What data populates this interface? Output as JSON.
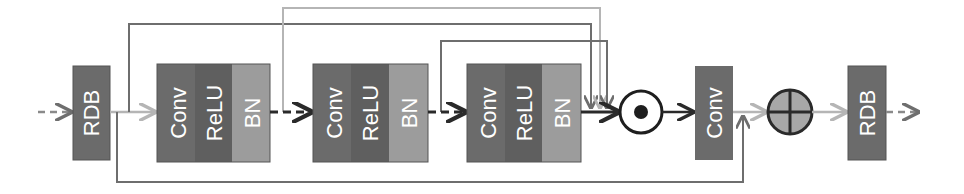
{
  "diagram": {
    "input_block": {
      "label": "RDB"
    },
    "output_block": {
      "label": "RDB"
    },
    "stages": [
      {
        "conv": "Conv",
        "relu": "ReLU",
        "bn": "BN"
      },
      {
        "conv": "Conv",
        "relu": "ReLU",
        "bn": "BN"
      },
      {
        "conv": "Conv",
        "relu": "ReLU",
        "bn": "BN"
      }
    ],
    "fusion_conv": {
      "label": "Conv"
    },
    "operators": {
      "multiply": "element-wise product (circle-dot)",
      "add": "element-wise sum (circle-plus)"
    },
    "colors": {
      "dark_block": "#6b6b6b",
      "relu_block": "#5f5f5f",
      "bn_block": "#9c9c9c",
      "dark_line": "#2a2a2a",
      "mid_line": "#6e6e6e",
      "light_line": "#b5b5b5",
      "add_fill": "#a8a8a8"
    }
  }
}
